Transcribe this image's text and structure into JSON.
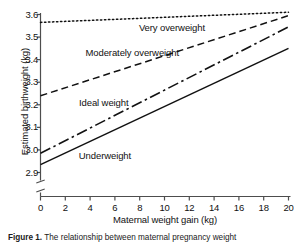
{
  "chart_data": {
    "type": "line",
    "title": "",
    "xlabel": "Maternal weight gain (kg)",
    "ylabel": "Estimated birthweight (kg)",
    "xlim": [
      0,
      20
    ],
    "ylim": [
      2.9,
      3.6
    ],
    "xticks": [
      "0",
      "2",
      "4",
      "6",
      "8",
      "10",
      "12",
      "14",
      "16",
      "18",
      "20"
    ],
    "yticks": [
      "2.9",
      "3.0",
      "3.1",
      "3.2",
      "3.3",
      "3.4",
      "3.5",
      "3.6"
    ],
    "grid": false,
    "legend_position": "inline-labels",
    "axis_break": {
      "axis": "y",
      "below": 2.9,
      "symbol": "zigzag"
    },
    "x": [
      0,
      20
    ],
    "series": [
      {
        "name": "Very overweight",
        "style": "dotted",
        "values": [
          3.565,
          3.61
        ],
        "label_x": 10.6,
        "label_y": 3.535
      },
      {
        "name": "Moderately overweight",
        "style": "dashed",
        "values": [
          3.24,
          3.595
        ],
        "label_x": 7.4,
        "label_y": 3.425
      },
      {
        "name": "Ideal weight",
        "style": "dash-dot",
        "values": [
          2.985,
          3.545
        ],
        "label_x": 5.1,
        "label_y": 3.205
      },
      {
        "name": "Underweight",
        "style": "solid",
        "values": [
          2.935,
          3.45
        ],
        "label_x": 5.2,
        "label_y": 2.97
      }
    ]
  },
  "caption": {
    "figure_number": "Figure 1.",
    "text": "The relationship between maternal pregnancy weight"
  },
  "colors": {
    "line": "#111111",
    "axis": "#4d4d4d",
    "text": "#1a1a1a",
    "background": "#ffffff"
  }
}
